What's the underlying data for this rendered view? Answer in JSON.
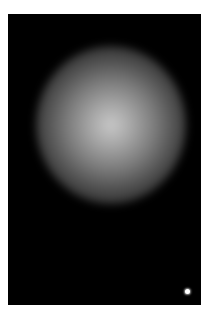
{
  "image": {
    "background_color": "#000000",
    "frame_color": "#ffffff",
    "glow_center_color": "#c8c8c8",
    "subjects": [
      {
        "name": "diffuse-glow",
        "description": "large soft radial glow"
      },
      {
        "name": "point-source",
        "description": "small bright dot, bottom-right"
      }
    ]
  }
}
